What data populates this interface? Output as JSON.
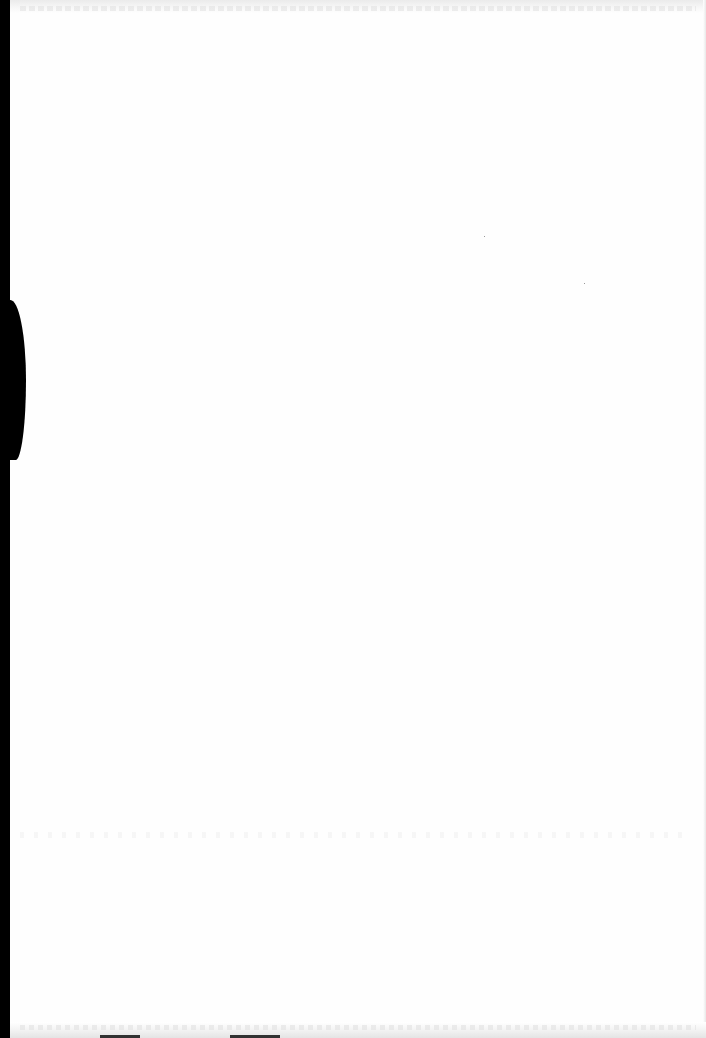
{
  "document": {
    "type": "scanned-page",
    "state": "blank",
    "visible_text": [],
    "artifacts": {
      "left_edge": "black scanner shadow along binding edge",
      "top_edge": "faint illegible bleed-through text",
      "bottom_edge": "faint illegible bleed-through text"
    },
    "colors": {
      "paper": "#fefefe",
      "shadow": "#000000",
      "bleed_through": "#e4e4e4"
    }
  }
}
